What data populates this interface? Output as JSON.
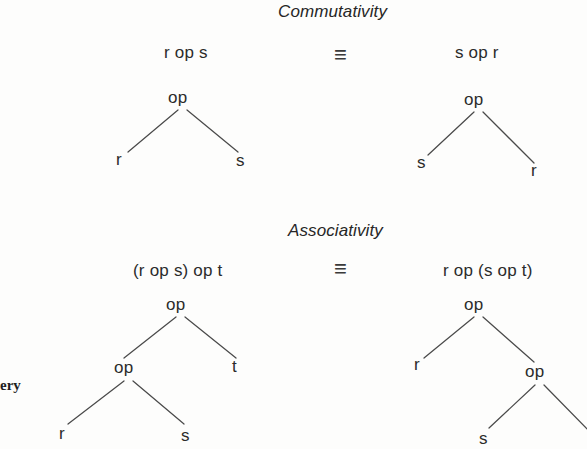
{
  "figure": {
    "background_color": "#fdfdfc",
    "line_color": "#4a4a4a",
    "text_color": "#2b2b2b",
    "margin_fragment": "ery"
  },
  "sections": [
    {
      "id": "commutativity",
      "title": "Commutativity",
      "relation_symbol": "≡",
      "left": {
        "expression": "r op s",
        "root": "op",
        "leaves": [
          "r",
          "s"
        ]
      },
      "right": {
        "expression": "s op r",
        "root": "op",
        "leaves": [
          "s",
          "r"
        ]
      }
    },
    {
      "id": "associativity",
      "title": "Associativity",
      "relation_symbol": "≡",
      "left": {
        "expression": "(r op s) op t",
        "root": "op",
        "inner_node": "op",
        "leaves": [
          "r",
          "s",
          "t"
        ]
      },
      "right": {
        "expression": "r op (s op t)",
        "root": "op",
        "inner_node": "op",
        "leaves": [
          "r",
          "s",
          "t"
        ]
      }
    }
  ]
}
